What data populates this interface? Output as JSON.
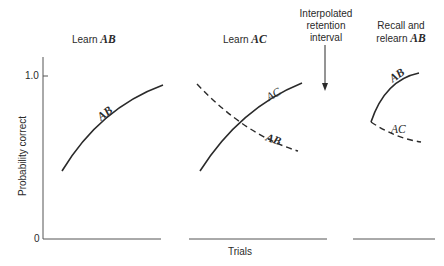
{
  "diagram": {
    "panels": [
      {
        "title_prefix": "Learn",
        "title_emph": "AB",
        "curves": [
          {
            "label": "AB",
            "style": "solid"
          }
        ]
      },
      {
        "title_prefix": "Learn",
        "title_emph": "AC",
        "curves": [
          {
            "label": "AC",
            "style": "solid"
          },
          {
            "label": "AB",
            "style": "dashed"
          }
        ]
      },
      {
        "title_line1": "Recall and",
        "title_prefix": "relearn",
        "title_emph": "AB",
        "curves": [
          {
            "label": "AB",
            "style": "solid"
          },
          {
            "label": "AC",
            "style": "dashed"
          }
        ]
      }
    ],
    "annotation": {
      "line1": "Interpolated",
      "line2": "retention",
      "line3": "interval",
      "icon": "down-arrow-icon"
    },
    "y_axis": {
      "label": "Probability correct",
      "ticks": [
        "1.0",
        "0"
      ]
    },
    "x_axis": {
      "label": "Trials"
    },
    "colors": {
      "line": "#2a2a2a",
      "axis": "#555555",
      "background": "#ffffff"
    }
  }
}
